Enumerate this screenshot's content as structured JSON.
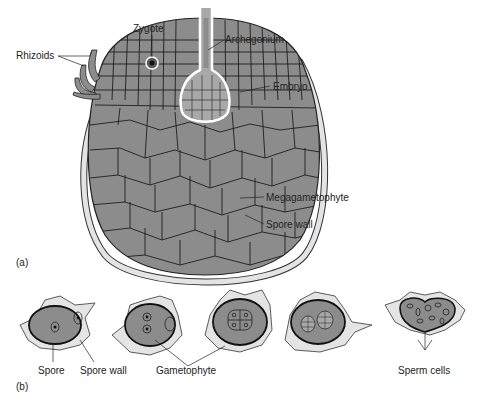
{
  "panel_a": {
    "label": "(a)",
    "labels": {
      "zygote": "Zygote",
      "archegonium": "Archegonium",
      "rhizoids": "Rhizoids",
      "embryo": "Embryo",
      "megagametophyte": "Megagametophyte",
      "spore_wall": "Spore wall"
    }
  },
  "panel_b": {
    "label": "(b)",
    "labels": {
      "spore": "Spore",
      "spore_wall": "Spore wall",
      "gametophyte": "Gametophyte",
      "sperm_cells": "Sperm cells"
    }
  },
  "colors": {
    "tissue": "#8c8c8c",
    "wall": "#e4e4e4",
    "outline": "#222222",
    "embryo_fill": "#a8a8a8"
  }
}
